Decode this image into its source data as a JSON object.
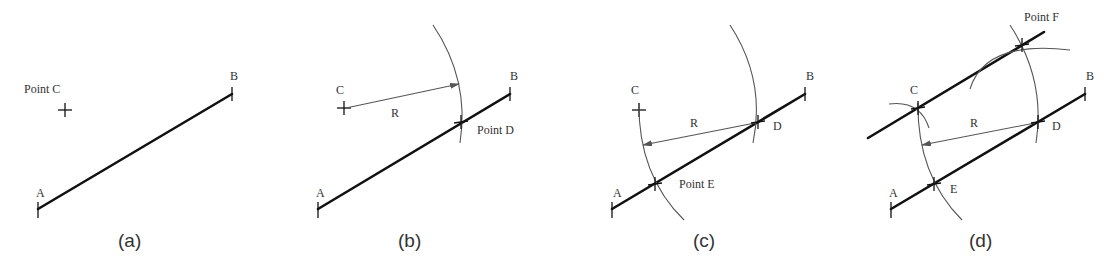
{
  "figure": {
    "panels": [
      {
        "caption": "(a)",
        "labels": {
          "A": "A",
          "B": "B",
          "C": "Point C"
        }
      },
      {
        "caption": "(b)",
        "labels": {
          "A": "A",
          "B": "B",
          "C": "C",
          "R": "R",
          "D": "Point D"
        }
      },
      {
        "caption": "(c)",
        "labels": {
          "A": "A",
          "B": "B",
          "C": "C",
          "R": "R",
          "D": "D",
          "E": "Point E"
        }
      },
      {
        "caption": "(d)",
        "labels": {
          "A": "A",
          "B": "B",
          "C": "C",
          "R": "R",
          "D": "D",
          "E": "E",
          "F": "Point F"
        }
      }
    ]
  }
}
